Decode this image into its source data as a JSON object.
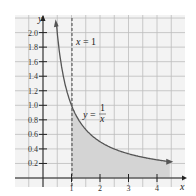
{
  "chart_data": {
    "type": "area",
    "title": "",
    "xlabel": "x",
    "ylabel": "y",
    "function": "y = 1/x",
    "curve_label": "y = 1/x",
    "vertical_line_label": "x = 1",
    "vertical_line_x": 1,
    "shaded_region": "area under y = 1/x for x >= 1",
    "x_ticks": [
      "1",
      "2",
      "3",
      "4"
    ],
    "y_ticks": [
      "0.2",
      "0.4",
      "0.6",
      "0.8",
      "1.0",
      "1.2",
      "1.4",
      "1.6",
      "1.8",
      "2.0"
    ],
    "xlim": [
      -1.5,
      4.8
    ],
    "ylim": [
      -0.1,
      2.2
    ],
    "grid": true,
    "x": [
      0.48,
      0.5,
      0.6,
      0.8,
      1,
      1.5,
      2,
      2.5,
      3,
      3.5,
      4,
      4.5
    ],
    "values": [
      2.08,
      2.0,
      1.67,
      1.25,
      1.0,
      0.67,
      0.5,
      0.4,
      0.33,
      0.29,
      0.25,
      0.22
    ]
  },
  "labels": {
    "x_axis": "x",
    "y_axis": "y",
    "vline": "x = 1",
    "curve_prefix": "y =",
    "curve_num": "1",
    "curve_den": "x"
  }
}
